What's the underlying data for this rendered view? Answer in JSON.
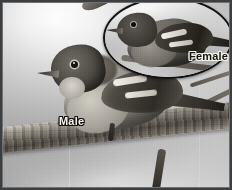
{
  "figure": {
    "kind": "photograph",
    "color_mode": "grayscale",
    "border_color": "#3c3e40"
  },
  "labels": {
    "male": "Male",
    "female": "Female"
  },
  "inset": {
    "shape": "oval",
    "outline_color": "#121212",
    "subject": "female-warbler"
  },
  "main_subject": {
    "subject": "male-warbler",
    "perch": "branch"
  }
}
